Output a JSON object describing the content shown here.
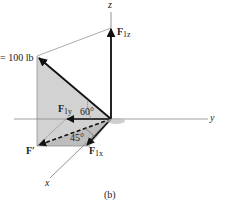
{
  "figure": {
    "caption": "(b)",
    "axes": {
      "x": "x",
      "y": "y",
      "z": "z"
    },
    "force_magnitude_label": "= 100 lb",
    "components": {
      "F1z": {
        "main": "F",
        "sub": "1z"
      },
      "F1y": {
        "main": "F",
        "sub": "1y"
      },
      "F1x": {
        "main": "F",
        "sub": "1x"
      },
      "F_prime": "F′"
    },
    "angles": {
      "a60": "60°",
      "a45": "45°"
    },
    "colors": {
      "shade": "#cfcfcf",
      "shade_dark": "#b8b8b8",
      "line": "#111111",
      "axis": "#777777"
    }
  }
}
